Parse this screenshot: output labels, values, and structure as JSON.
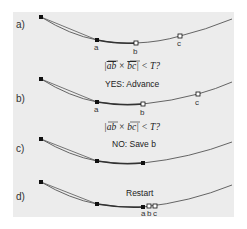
{
  "panels": [
    {
      "id": "a",
      "label": "a)",
      "points": {
        "a": "a",
        "b": "b",
        "c": "c"
      }
    },
    {
      "id": "b",
      "label": "b)",
      "formula": {
        "ab": "ab",
        "times": " × ",
        "bc": "bc",
        "rest": " < T?"
      },
      "caption": "YES: Advance",
      "points": {
        "a": "a",
        "b": "b",
        "c": "c"
      }
    },
    {
      "id": "c",
      "label": "c)",
      "formula": {
        "ab": "ab",
        "times": " × ",
        "bc": "bc",
        "rest": " < T?"
      },
      "caption": "NO: Save b"
    },
    {
      "id": "d",
      "label": "d)",
      "caption": "Restart",
      "points": {
        "a": "a",
        "b": "b",
        "c": "c"
      }
    }
  ],
  "colors": {
    "background": "#ececec",
    "curve": "#555555",
    "marker": "#111111"
  }
}
